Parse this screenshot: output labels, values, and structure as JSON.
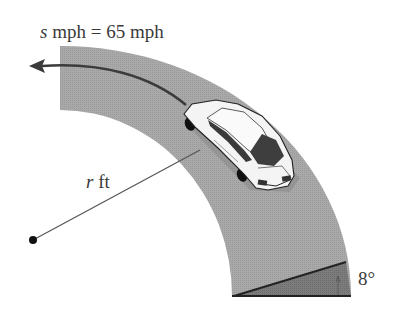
{
  "diagram": {
    "speed_label": {
      "variable": "s",
      "text": " mph = 65 mph"
    },
    "radius_label": {
      "variable": "r",
      "text": " ft"
    },
    "bank_angle_label": "8°",
    "colors": {
      "road": "#a8a8a8",
      "bank": "#7a7a7a",
      "line": "#333333",
      "arrow": "#555555",
      "car_body": "#f2f2f2",
      "car_window": "#3c3c3c",
      "text": "#3a3a3a"
    },
    "elements": {
      "center_point": "dot",
      "road": "quarter-annulus curved road",
      "car": "sedan driving on curve",
      "arrow": "direction of travel",
      "bank_triangle": "banked road cross-section"
    }
  }
}
